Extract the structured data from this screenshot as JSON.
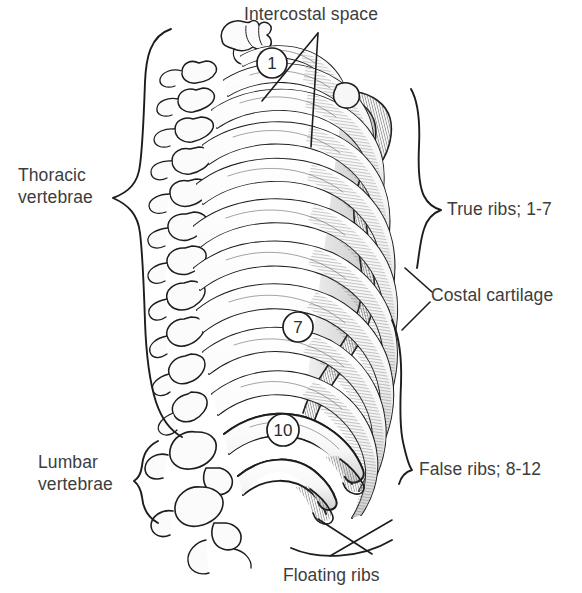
{
  "figure": {
    "background": "#ffffff",
    "ink": "#1d1d1d",
    "text_color": "#3d3d3d",
    "bone_fill": "#fdfdfd",
    "shade_fill": "#e2e2e2"
  },
  "labels": {
    "intercostal_space": "Intercostal space",
    "thoracic_vertebrae_line1": "Thoracic",
    "thoracic_vertebrae_line2": "vertebrae",
    "true_ribs": "True ribs; 1-7",
    "costal_cartilage": "Costal cartilage",
    "false_ribs": "False ribs; 8-12",
    "lumbar_vertebrae_line1": "Lumbar",
    "lumbar_vertebrae_line2": "vertebrae",
    "floating_ribs": "Floating ribs"
  },
  "callouts": [
    {
      "id": "rib-1",
      "text": "1",
      "cx": 272,
      "cy": 63,
      "r": 15
    },
    {
      "id": "rib-7",
      "text": "7",
      "cx": 298,
      "cy": 327,
      "r": 15
    },
    {
      "id": "rib-10",
      "text": "10",
      "cx": 283,
      "cy": 430,
      "r": 16
    }
  ],
  "braces": [
    {
      "id": "thoracic-vertebrae-brace",
      "side": "left",
      "top": 28,
      "bottom": 437,
      "tip_x": 112,
      "tip_y": 198
    },
    {
      "id": "lumbar-vertebrae-brace",
      "side": "left",
      "top": 440,
      "bottom": 522,
      "tip_x": 134,
      "tip_y": 481
    },
    {
      "id": "true-ribs-brace",
      "side": "right",
      "top": 88,
      "bottom": 272,
      "tip_x": 441,
      "tip_y": 210
    },
    {
      "id": "false-ribs-brace",
      "side": "right",
      "top": 318,
      "bottom": 486,
      "tip_x": 412,
      "tip_y": 470
    },
    {
      "id": "floating-ribs-brace",
      "side": "bottom",
      "top": 540,
      "bottom": 560,
      "tip_x": 352,
      "tip_y": 556
    }
  ],
  "anatomy": {
    "rib_count": 12,
    "true_ribs_range": "1-7",
    "false_ribs_range": "8-12",
    "floating_ribs_range": "11-12",
    "vertebrae_regions": [
      "thoracic",
      "lumbar"
    ]
  }
}
